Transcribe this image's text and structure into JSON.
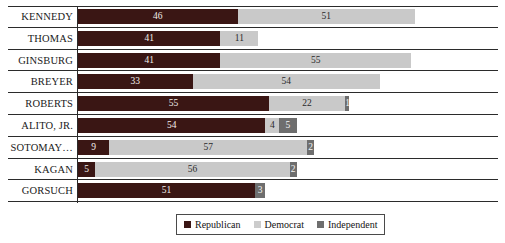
{
  "chart_data": {
    "type": "bar",
    "orientation": "horizontal",
    "stacked": true,
    "title": "",
    "subtitle": "",
    "xlabel": "",
    "ylabel": "",
    "grid": true,
    "xlim": [
      0,
      121
    ],
    "legend_position": "bottom-center",
    "categories": [
      "KENNEDY",
      "THOMAS",
      "GINSBURG",
      "BREYER",
      "ROBERTS",
      "ALITO, JR.",
      "SOTOMAY…",
      "KAGAN",
      "GORSUCH"
    ],
    "series": [
      {
        "name": "Republican",
        "color": "#3a1614",
        "values": [
          46,
          41,
          41,
          33,
          55,
          54,
          9,
          5,
          51
        ]
      },
      {
        "name": "Democrat",
        "color": "#c9c9c9",
        "values": [
          51,
          11,
          55,
          54,
          22,
          4,
          57,
          56,
          0
        ]
      },
      {
        "name": "Independent",
        "color": "#6e6e6e",
        "values": [
          0,
          0,
          0,
          0,
          1,
          5,
          2,
          2,
          3
        ]
      }
    ],
    "bar_labels": [
      {
        "category": "KENNEDY",
        "segments": [
          {
            "series": "Republican",
            "label": "46"
          },
          {
            "series": "Democrat",
            "label": "51"
          }
        ]
      },
      {
        "category": "THOMAS",
        "segments": [
          {
            "series": "Republican",
            "label": "41"
          },
          {
            "series": "Democrat",
            "label": "11"
          }
        ]
      },
      {
        "category": "GINSBURG",
        "segments": [
          {
            "series": "Republican",
            "label": "41"
          },
          {
            "series": "Democrat",
            "label": "55"
          }
        ]
      },
      {
        "category": "BREYER",
        "segments": [
          {
            "series": "Republican",
            "label": "33"
          },
          {
            "series": "Democrat",
            "label": "54"
          }
        ]
      },
      {
        "category": "ROBERTS",
        "segments": [
          {
            "series": "Republican",
            "label": "55"
          },
          {
            "series": "Democrat",
            "label": "22"
          },
          {
            "series": "Independent",
            "label": "1"
          }
        ]
      },
      {
        "category": "ALITO, JR.",
        "segments": [
          {
            "series": "Republican",
            "label": "54"
          },
          {
            "series": "Democrat",
            "label": "4"
          },
          {
            "series": "Independent",
            "label": "5"
          }
        ]
      },
      {
        "category": "SOTOMAY…",
        "segments": [
          {
            "series": "Republican",
            "label": "9"
          },
          {
            "series": "Democrat",
            "label": "57"
          },
          {
            "series": "Independent",
            "label": "2"
          }
        ]
      },
      {
        "category": "KAGAN",
        "segments": [
          {
            "series": "Republican",
            "label": "5"
          },
          {
            "series": "Democrat",
            "label": "56"
          },
          {
            "series": "Independent",
            "label": "2"
          }
        ]
      },
      {
        "category": "GORSUCH",
        "segments": [
          {
            "series": "Republican",
            "label": "51"
          },
          {
            "series": "Independent",
            "label": "3"
          }
        ]
      }
    ]
  },
  "legend": {
    "items": [
      {
        "label": "Republican",
        "color": "#3a1614"
      },
      {
        "label": "Democrat",
        "color": "#c9c9c9"
      },
      {
        "label": "Independent",
        "color": "#6e6e6e"
      }
    ]
  }
}
